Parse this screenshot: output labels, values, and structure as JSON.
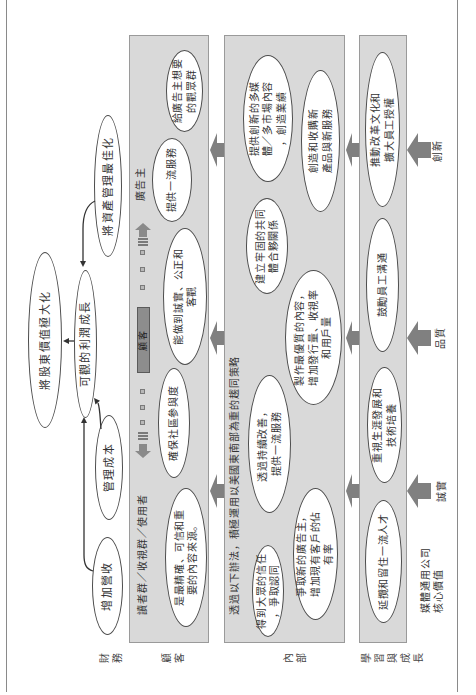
{
  "row_labels": {
    "financial": "財務",
    "customer": "顧客",
    "internal": "內部",
    "learning": "學習與成長"
  },
  "financial": {
    "shareholder_value": "將股東價值極大化",
    "profit_growth": "可觀的利潤成長",
    "asset_management": "將資產管理最佳化",
    "manage_costs": "管理成本",
    "increase_revenue": "增加營收"
  },
  "customer": {
    "segment_readers": "讀者群／收視群／使用者",
    "segment_advertisers": "廣告主",
    "spectrum_label": "顧客",
    "objectives": {
      "trusted_source": "是最精確、可信和重\n要的內容來源。",
      "community": "確保社區參與度",
      "honest_fair": "能做到誠實、公正和\n客觀",
      "service": "提供一流服務",
      "audience": "給廣告主想要\n的觀眾群"
    }
  },
  "internal": {
    "header": "透過以下辦法，積極運用以美國東南部為重的趨同策略",
    "objectives": {
      "public_trust": "得到大眾的信任\n，爭取認同",
      "new_advertisers": "爭取新的廣告主，\n增加現有客戶的佔\n有率",
      "continuous_improvement": "透過持續改善，\n提供一流服務",
      "quality_content": "製作最優質的內容，\n增加發行量、收視率\n和用戶量",
      "partnerships": "建立牢固的共同\n體合夥關係",
      "multimedia_content": "提供創新的多媒\n體／多市場內容\n，創造業績",
      "new_products": "創造和收購新\n產品與新服務"
    }
  },
  "learning": {
    "objectives": {
      "talent": "延攬和留住一流人才",
      "career": "重視生涯發展和\n技術培養",
      "communication": "鼓勵員工溝通",
      "culture": "推動改革文化和\n擴大員工授權"
    }
  },
  "core_values": {
    "title_line1": "媒體通用公司",
    "title_line2": "核心價值",
    "values": {
      "integrity": "誠實",
      "quality": "品質",
      "innovation": "創新"
    }
  },
  "colors": {
    "band_fill": "#d9d9d9",
    "band_border": "#9a9a9a",
    "arrow": "#808080",
    "ellipse_border": "#4d4d4d",
    "spectrum_bar": "#8d8d8d"
  }
}
